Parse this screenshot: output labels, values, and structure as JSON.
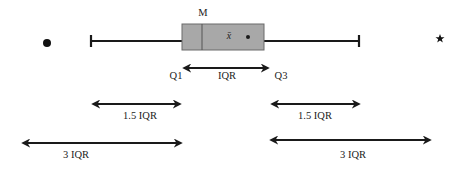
{
  "diagram": {
    "type": "boxplot-explanation",
    "labels": {
      "median": "M",
      "mean": "x̄",
      "q1": "Q1",
      "q3": "Q3",
      "iqr": "IQR",
      "left_1_5": "1.5 IQR",
      "right_1_5": "1.5 IQR",
      "left_3": "3 IQR",
      "right_3": "3 IQR"
    },
    "markers": {
      "outlier_near": "filled-circle",
      "outlier_far": "star"
    },
    "colors": {
      "box_fill": "#a8a8a8",
      "line": "#1a1a1a",
      "background": "#ffffff"
    }
  }
}
